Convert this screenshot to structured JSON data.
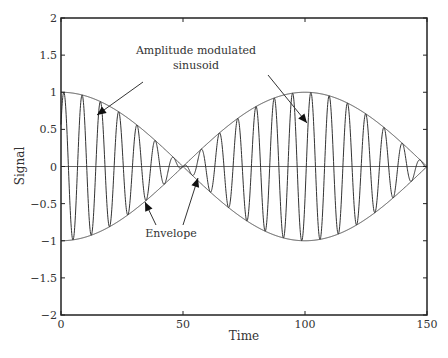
{
  "chart_data": {
    "type": "line",
    "title": "",
    "xlabel": "Time",
    "ylabel": "Signal",
    "xlim": [
      0,
      150
    ],
    "ylim": [
      -2,
      2
    ],
    "xticks": [
      "0",
      "50",
      "100",
      "150"
    ],
    "yticks": [
      "-2",
      "-1.5",
      "-1",
      "-0.5",
      "0",
      "0.5",
      "1",
      "1.5",
      "2"
    ],
    "grid": false,
    "legend": null,
    "series": [
      {
        "name": "Amplitude modulated sinusoid",
        "formula": "cos(2*pi*t/200) * sin(2*pi*t/7.5)",
        "carrier_period": 7.5,
        "envelope_period": 200
      },
      {
        "name": "Envelope (upper)",
        "formula": "cos(2*pi*t/200)"
      },
      {
        "name": "Envelope (lower)",
        "formula": "-cos(2*pi*t/200)"
      }
    ],
    "annotations": [
      {
        "text": "Amplitude modulated",
        "line2": "sinusoid"
      },
      {
        "text": "Envelope"
      }
    ],
    "zero_line": true
  }
}
